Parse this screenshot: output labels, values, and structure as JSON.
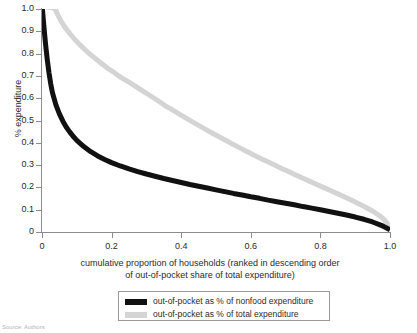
{
  "chart_data": {
    "type": "line",
    "title": "",
    "xlabel": "cumulative proportion of households (ranked in descending order of out-of-pocket share of total expenditure)",
    "xlabel_line1": "cumulative proportion of households (ranked in descending order",
    "xlabel_line2": "of out-of-pocket share of total expenditure)",
    "ylabel": "% expenditure",
    "xlim": [
      0,
      1.0
    ],
    "ylim": [
      0,
      1.0
    ],
    "grid": false,
    "legend_position": "below-plot",
    "xticks": [
      "0",
      "0.2",
      "0.4",
      "0.6",
      "0.8",
      "1.0"
    ],
    "xtick_values": [
      0,
      0.2,
      0.4,
      0.6,
      0.8,
      1.0
    ],
    "yticks": [
      "0",
      "0.1",
      "0.2",
      "0.3",
      "0.4",
      "0.5",
      "0.6",
      "0.7",
      "0.8",
      "0.9",
      "1.0"
    ],
    "ytick_values": [
      0,
      0.1,
      0.2,
      0.3,
      0.4,
      0.5,
      0.6,
      0.7,
      0.8,
      0.9,
      1.0
    ],
    "series": [
      {
        "name": "out-of-pocket as % of nonfood expenditure",
        "color": "#111111",
        "linewidth": 5,
        "x": [
          0.0,
          0.005,
          0.01,
          0.015,
          0.02,
          0.025,
          0.03,
          0.04,
          0.05,
          0.06,
          0.07,
          0.08,
          0.09,
          0.1,
          0.12,
          0.14,
          0.16,
          0.18,
          0.2,
          0.225,
          0.25,
          0.275,
          0.3,
          0.325,
          0.35,
          0.375,
          0.4,
          0.425,
          0.45,
          0.475,
          0.5,
          0.525,
          0.55,
          0.575,
          0.6,
          0.625,
          0.65,
          0.675,
          0.7,
          0.725,
          0.75,
          0.775,
          0.8,
          0.825,
          0.85,
          0.875,
          0.9,
          0.925,
          0.95,
          0.975,
          1.0
        ],
        "y": [
          1.02,
          0.93,
          0.845,
          0.775,
          0.715,
          0.665,
          0.625,
          0.57,
          0.53,
          0.497,
          0.47,
          0.448,
          0.428,
          0.411,
          0.383,
          0.36,
          0.341,
          0.325,
          0.311,
          0.296,
          0.283,
          0.271,
          0.26,
          0.25,
          0.24,
          0.231,
          0.222,
          0.213,
          0.205,
          0.197,
          0.189,
          0.181,
          0.173,
          0.166,
          0.158,
          0.151,
          0.143,
          0.136,
          0.129,
          0.122,
          0.114,
          0.107,
          0.1,
          0.092,
          0.084,
          0.076,
          0.067,
          0.057,
          0.045,
          0.03,
          0.01
        ]
      },
      {
        "name": "out-of-pocket as % of total expenditure",
        "color": "#d4d4d4",
        "linewidth": 5,
        "x": [
          0.0,
          0.01,
          0.02,
          0.03,
          0.038,
          0.045,
          0.055,
          0.065,
          0.08,
          0.095,
          0.11,
          0.13,
          0.15,
          0.17,
          0.19,
          0.205,
          0.215,
          0.23,
          0.25,
          0.27,
          0.29,
          0.31,
          0.33,
          0.345,
          0.355,
          0.37,
          0.39,
          0.41,
          0.43,
          0.45,
          0.47,
          0.49,
          0.51,
          0.53,
          0.55,
          0.57,
          0.59,
          0.61,
          0.63,
          0.65,
          0.67,
          0.69,
          0.71,
          0.73,
          0.75,
          0.77,
          0.79,
          0.81,
          0.83,
          0.85,
          0.87,
          0.89,
          0.91,
          0.93,
          0.95,
          0.97,
          0.985,
          1.0
        ],
        "y": [
          1.01,
          1.01,
          1.008,
          1.005,
          1.0,
          0.975,
          0.945,
          0.92,
          0.89,
          0.862,
          0.838,
          0.808,
          0.782,
          0.757,
          0.733,
          0.718,
          0.706,
          0.69,
          0.672,
          0.652,
          0.632,
          0.612,
          0.592,
          0.576,
          0.565,
          0.552,
          0.533,
          0.514,
          0.496,
          0.478,
          0.46,
          0.443,
          0.426,
          0.409,
          0.392,
          0.376,
          0.36,
          0.344,
          0.329,
          0.314,
          0.299,
          0.284,
          0.27,
          0.255,
          0.241,
          0.227,
          0.213,
          0.199,
          0.185,
          0.171,
          0.157,
          0.142,
          0.127,
          0.111,
          0.094,
          0.073,
          0.053,
          0.022
        ]
      }
    ]
  },
  "legend": {
    "items": [
      {
        "label": "out-of-pocket as % of nonfood expenditure",
        "color": "#111111"
      },
      {
        "label": "out-of-pocket as % of total expenditure",
        "color": "#d4d4d4"
      }
    ]
  },
  "footer": {
    "source": "Source: Authors"
  }
}
